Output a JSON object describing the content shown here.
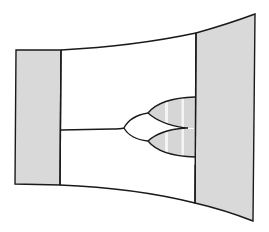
{
  "diagram": {
    "type": "schematic-line-drawing",
    "colors": {
      "stroke": "#1a1a1a",
      "panel_fill": "#d9d9d9",
      "lobe_fill": "#d6d6d6",
      "stripe": "#f4f4f4",
      "background": "#ffffff"
    },
    "elements": {
      "left_panel": {
        "label": ""
      },
      "right_panel": {
        "label": ""
      },
      "center_chamber": {
        "label": ""
      },
      "stem": {
        "label": ""
      },
      "branch_tree": {
        "levels": 2,
        "terminal_lobes": 2
      }
    }
  }
}
